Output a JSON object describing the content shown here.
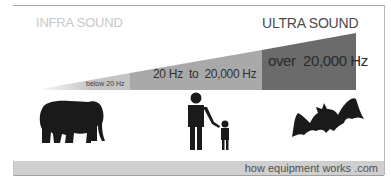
{
  "titles": {
    "left": "INFRA SOUND",
    "right": "ULTRA SOUND"
  },
  "ranges": [
    {
      "label": "below 20 Hz",
      "color": "#c4c4c4"
    },
    {
      "label": "20 Hz  to  20,000 Hz",
      "color": "#a9a9a9"
    },
    {
      "label": "over  20,000 Hz",
      "color": "#6b6b6b"
    }
  ],
  "icons": {
    "infra": "elephant-icon",
    "audible": "adult-and-child-icon",
    "ultra": "bat-icon"
  },
  "footer": {
    "text": "how equipment works .com"
  },
  "colors": {
    "title_left": "#c8c8c8",
    "title_right": "#4a4a4a",
    "footer_bg": "#cfcfcf",
    "silhouette": "#1a1a1a"
  }
}
